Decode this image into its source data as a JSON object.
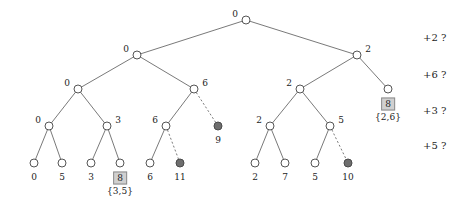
{
  "figure": {
    "colors": {
      "open_node_stroke": "#555555",
      "filled_node_fill": "#6e6e6e",
      "edge": "#6a6a6a",
      "box_fill": "#d0d0d0",
      "box_border": "#8c8c8c",
      "text": "#1d1d1d",
      "background": "#ffffff"
    }
  },
  "chart_data": {
    "type": "diagram",
    "title": "",
    "xlabel": "",
    "ylabel": "",
    "levels": [
      20,
      55,
      89,
      126,
      163
    ],
    "nodes": [
      {
        "id": "root",
        "x": 246,
        "y": 20,
        "style": "open",
        "label": "0",
        "label_pos": "left"
      },
      {
        "id": "l1a",
        "x": 137,
        "y": 55,
        "style": "open",
        "label": "0",
        "label_pos": "left"
      },
      {
        "id": "l1b",
        "x": 357,
        "y": 55,
        "style": "open",
        "label": "2",
        "label_pos": "right"
      },
      {
        "id": "l2a",
        "x": 78,
        "y": 89,
        "style": "open",
        "label": "0",
        "label_pos": "left"
      },
      {
        "id": "l2b",
        "x": 194,
        "y": 89,
        "style": "open",
        "label": "6",
        "label_pos": "right"
      },
      {
        "id": "l2c",
        "x": 300,
        "y": 89,
        "style": "open",
        "label": "2",
        "label_pos": "left"
      },
      {
        "id": "l2d",
        "x": 388,
        "y": 89,
        "style": "open",
        "label": "",
        "label_pos": "right"
      },
      {
        "id": "l3a",
        "x": 49,
        "y": 126,
        "style": "open",
        "label": "0",
        "label_pos": "left"
      },
      {
        "id": "l3b",
        "x": 107,
        "y": 126,
        "style": "open",
        "label": "3",
        "label_pos": "right"
      },
      {
        "id": "l3c",
        "x": 166,
        "y": 126,
        "style": "open",
        "label": "6",
        "label_pos": "left"
      },
      {
        "id": "l3d",
        "x": 218,
        "y": 126,
        "style": "filled",
        "label": "9",
        "label_pos": "below"
      },
      {
        "id": "l3e",
        "x": 270,
        "y": 126,
        "style": "open",
        "label": "2",
        "label_pos": "left"
      },
      {
        "id": "l3f",
        "x": 330,
        "y": 126,
        "style": "open",
        "label": "5",
        "label_pos": "right"
      },
      {
        "id": "leaf0",
        "x": 34,
        "y": 163,
        "style": "open",
        "label": "0",
        "label_pos": "below"
      },
      {
        "id": "leaf1",
        "x": 62,
        "y": 163,
        "style": "open",
        "label": "5",
        "label_pos": "below"
      },
      {
        "id": "leaf2",
        "x": 91,
        "y": 163,
        "style": "open",
        "label": "3",
        "label_pos": "below"
      },
      {
        "id": "leaf3",
        "x": 120,
        "y": 163,
        "style": "open",
        "label": "8",
        "label_pos": "below-box"
      },
      {
        "id": "leaf4",
        "x": 150,
        "y": 163,
        "style": "open",
        "label": "6",
        "label_pos": "below"
      },
      {
        "id": "leaf5",
        "x": 180,
        "y": 163,
        "style": "filled",
        "label": "11",
        "label_pos": "below"
      },
      {
        "id": "leaf6",
        "x": 255,
        "y": 163,
        "style": "open",
        "label": "2",
        "label_pos": "below"
      },
      {
        "id": "leaf7",
        "x": 285,
        "y": 163,
        "style": "open",
        "label": "7",
        "label_pos": "below"
      },
      {
        "id": "leaf8",
        "x": 315,
        "y": 163,
        "style": "open",
        "label": "5",
        "label_pos": "below"
      },
      {
        "id": "leaf9",
        "x": 348,
        "y": 163,
        "style": "filled",
        "label": "10",
        "label_pos": "below"
      }
    ],
    "edges": [
      {
        "from": "root",
        "to": "l1a",
        "style": "solid"
      },
      {
        "from": "root",
        "to": "l1b",
        "style": "solid"
      },
      {
        "from": "l1a",
        "to": "l2a",
        "style": "solid"
      },
      {
        "from": "l1a",
        "to": "l2b",
        "style": "solid"
      },
      {
        "from": "l1b",
        "to": "l2c",
        "style": "solid"
      },
      {
        "from": "l1b",
        "to": "l2d",
        "style": "solid"
      },
      {
        "from": "l2a",
        "to": "l3a",
        "style": "solid"
      },
      {
        "from": "l2a",
        "to": "l3b",
        "style": "solid"
      },
      {
        "from": "l2b",
        "to": "l3c",
        "style": "solid"
      },
      {
        "from": "l2b",
        "to": "l3d",
        "style": "dashed"
      },
      {
        "from": "l2c",
        "to": "l3e",
        "style": "solid"
      },
      {
        "from": "l2c",
        "to": "l3f",
        "style": "solid"
      },
      {
        "from": "l3a",
        "to": "leaf0",
        "style": "solid"
      },
      {
        "from": "l3a",
        "to": "leaf1",
        "style": "solid"
      },
      {
        "from": "l3b",
        "to": "leaf2",
        "style": "solid"
      },
      {
        "from": "l3b",
        "to": "leaf3",
        "style": "solid"
      },
      {
        "from": "l3c",
        "to": "leaf4",
        "style": "solid"
      },
      {
        "from": "l3c",
        "to": "leaf5",
        "style": "dashed"
      },
      {
        "from": "l3e",
        "to": "leaf6",
        "style": "solid"
      },
      {
        "from": "l3e",
        "to": "leaf7",
        "style": "solid"
      },
      {
        "from": "l3f",
        "to": "leaf8",
        "style": "solid"
      },
      {
        "from": "l3f",
        "to": "leaf9",
        "style": "dashed"
      }
    ],
    "boxed_values": [
      {
        "id": "box-right",
        "value": "8",
        "set": "{2,6}",
        "x": 388,
        "y": 104,
        "set_y": 117
      },
      {
        "id": "box-left",
        "value": "8",
        "set": "{3,5}",
        "x": 120,
        "y": 178,
        "set_y": 191
      }
    ],
    "annotations": [
      {
        "id": "annot-1",
        "text": "+2 ?",
        "x": 423,
        "y": 38
      },
      {
        "id": "annot-2",
        "text": "+6 ?",
        "x": 423,
        "y": 75
      },
      {
        "id": "annot-3",
        "text": "+3 ?",
        "x": 423,
        "y": 111
      },
      {
        "id": "annot-4",
        "text": "+5 ?",
        "x": 423,
        "y": 146
      }
    ]
  }
}
